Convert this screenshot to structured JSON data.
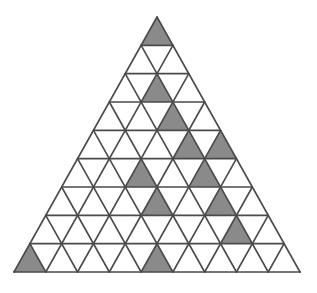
{
  "figure": {
    "type": "triangular-grid",
    "rows": 9,
    "apex": {
      "x": 157,
      "y": 17
    },
    "bottom_left": {
      "x": 14,
      "y": 272
    },
    "bottom_right": {
      "x": 300,
      "y": 272
    },
    "colors": {
      "background": "#ffffff",
      "line": "#4a4a4a",
      "shaded_fill": "#8a8a8a",
      "empty_fill": "#ffffff"
    },
    "line_width": 1.6,
    "row_cell_counts": [
      1,
      3,
      5,
      7,
      9,
      11,
      13,
      15,
      17
    ],
    "shaded_cells": [
      {
        "row": 1,
        "index": 1,
        "orientation": "up"
      },
      {
        "row": 3,
        "index": 3,
        "orientation": "up"
      },
      {
        "row": 4,
        "index": 5,
        "orientation": "up"
      },
      {
        "row": 5,
        "index": 7,
        "orientation": "up"
      },
      {
        "row": 5,
        "index": 9,
        "orientation": "up"
      },
      {
        "row": 6,
        "index": 5,
        "orientation": "up"
      },
      {
        "row": 6,
        "index": 9,
        "orientation": "up"
      },
      {
        "row": 7,
        "index": 7,
        "orientation": "up"
      },
      {
        "row": 7,
        "index": 11,
        "orientation": "up"
      },
      {
        "row": 8,
        "index": 13,
        "orientation": "up"
      },
      {
        "row": 9,
        "index": 1,
        "orientation": "up"
      },
      {
        "row": 9,
        "index": 9,
        "orientation": "up"
      }
    ],
    "shaded_count": 12,
    "total_cells": 81
  }
}
